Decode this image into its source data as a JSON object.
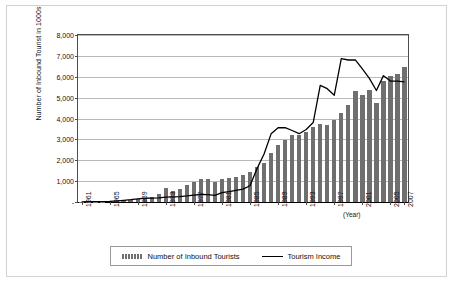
{
  "chart_data": {
    "type": "bar",
    "title": "",
    "xlabel": "(Year)",
    "ylabel": "Number of Inbound Tourist in 1000s",
    "ylim": [
      0,
      8000
    ],
    "ytick_labels": [
      "8,000",
      "7,000",
      "6,000",
      "5,000",
      "4,000",
      "3,000",
      "2,000",
      "1,000",
      "-"
    ],
    "ytick_values": [
      8000,
      7000,
      6000,
      5000,
      4000,
      3000,
      2000,
      1000,
      0
    ],
    "xtick_labels": [
      "1961",
      "1965",
      "1969",
      "1973",
      "1977",
      "1981",
      "1985",
      "1989",
      "1993",
      "1997",
      "2001",
      "2005",
      "2007"
    ],
    "grid": true,
    "legend_position": "bottom",
    "categories": [
      "1961",
      "1962",
      "1963",
      "1964",
      "1965",
      "1966",
      "1967",
      "1968",
      "1969",
      "1970",
      "1971",
      "1972",
      "1973",
      "1974",
      "1975",
      "1976",
      "1977",
      "1978",
      "1979",
      "1980",
      "1981",
      "1982",
      "1983",
      "1984",
      "1985",
      "1986",
      "1987",
      "1988",
      "1989",
      "1990",
      "1991",
      "1992",
      "1993",
      "1994",
      "1995",
      "1996",
      "1997",
      "1998",
      "1999",
      "2000",
      "2001",
      "2002",
      "2003",
      "2004",
      "2005",
      "2006",
      "2007"
    ],
    "series": [
      {
        "name": "Number of Inbound Tourists",
        "type": "bar",
        "color": "#6f6f6f",
        "values": [
          11,
          15,
          22,
          24,
          33,
          67,
          84,
          102,
          126,
          173,
          233,
          371,
          679,
          517,
          633,
          834,
          949,
          1079,
          1126,
          976,
          1093,
          1145,
          1194,
          1298,
          1426,
          1660,
          1875,
          2340,
          2728,
          2959,
          3196,
          3231,
          3331,
          3580,
          3753,
          3684,
          3908,
          4250,
          4660,
          5322,
          5147,
          5347,
          4753,
          5818,
          6022,
          6155,
          6448
        ]
      },
      {
        "name": "Tourism Income",
        "type": "line",
        "color": "#000000",
        "values": [
          10,
          12,
          18,
          20,
          30,
          55,
          80,
          110,
          150,
          180,
          190,
          200,
          230,
          250,
          260,
          290,
          330,
          360,
          350,
          320,
          450,
          500,
          560,
          620,
          780,
          1600,
          2300,
          3265,
          3556,
          3559,
          3426,
          3272,
          3474,
          3806,
          5587,
          5430,
          5116,
          6865,
          6802,
          6811,
          6373,
          5919,
          5343,
          6053,
          5793,
          5788,
          5750
        ]
      }
    ]
  },
  "legend": {
    "items": [
      {
        "label": "Number of Inbound Tourists",
        "marker": "bar-swatch"
      },
      {
        "label": "Tourism Income",
        "marker": "line-swatch"
      }
    ]
  }
}
